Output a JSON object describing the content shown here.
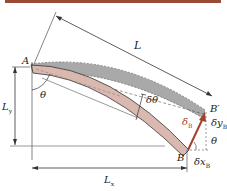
{
  "diagram": {
    "colors": {
      "top_bar": "#9b4a33",
      "beam_fill": "#d9b8b0",
      "deflected_shadow": "#a9a9a9",
      "arrow": "#a0412a",
      "line": "#333333"
    },
    "labels": {
      "A": "A",
      "L": "L",
      "Ly": "L",
      "Ly_sub": "y",
      "theta_A": "θ",
      "dtheta": "δθ",
      "B_prime": "B′",
      "delta_B": "δ",
      "delta_B_sub": "B",
      "dyB": "δy",
      "dyB_sub": "B",
      "theta_B": "θ",
      "B": "B",
      "dxB": "δx",
      "dxB_sub": "B",
      "Lx": "L",
      "Lx_sub": "x"
    }
  }
}
